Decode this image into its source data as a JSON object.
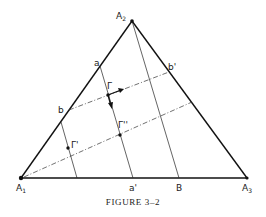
{
  "figure": {
    "caption": "Figure 3–2",
    "caption_display": "FIGURE 3–2",
    "vertices": {
      "A1": {
        "label": "A",
        "sub": "1",
        "x": 21,
        "y": 178
      },
      "A2": {
        "label": "A",
        "sub": "2",
        "x": 132,
        "y": 21
      },
      "A3": {
        "label": "A",
        "sub": "3",
        "x": 247,
        "y": 178
      }
    },
    "points": {
      "a": {
        "label": "a",
        "x": 100,
        "y": 66
      },
      "b": {
        "label": "b",
        "x": 69,
        "y": 110
      },
      "b_prime": {
        "label": "b'",
        "x": 169,
        "y": 72
      },
      "a_prime": {
        "label": "a'",
        "x": 133,
        "y": 178
      },
      "B": {
        "label": "B",
        "x": 179,
        "y": 178
      },
      "Gamma": {
        "label": "Γ",
        "x": 108,
        "y": 95
      },
      "Gamma_prime": {
        "label": "Γ'",
        "x": 68,
        "y": 148
      },
      "Gamma_double_prime": {
        "label": "Γ''",
        "x": 120,
        "y": 135
      }
    },
    "colors": {
      "line": "#111111",
      "background": "#ffffff"
    }
  }
}
